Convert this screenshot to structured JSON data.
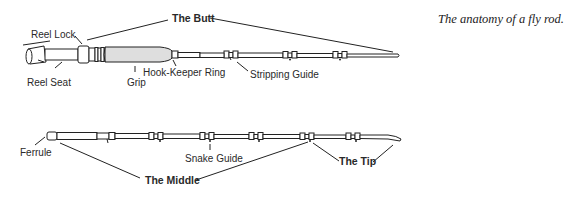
{
  "caption": "The anatomy of a fly rod.",
  "diagram": {
    "top_rod": {
      "section_label": "The Butt",
      "labels": {
        "reel_lock": "Reel Lock",
        "reel_seat": "Reel Seat",
        "grip": "Grip",
        "hook_keeper_ring": "Hook-Keeper Ring",
        "stripping_guide": "Stripping Guide"
      }
    },
    "bottom_rod": {
      "labels": {
        "ferrule": "Ferrule",
        "snake_guide": "Snake Guide"
      },
      "section_labels": {
        "middle": "The Middle",
        "tip": "The Tip"
      }
    }
  },
  "colors": {
    "line": "#222222",
    "grip_fill": "#dedede",
    "background": "#ffffff"
  }
}
